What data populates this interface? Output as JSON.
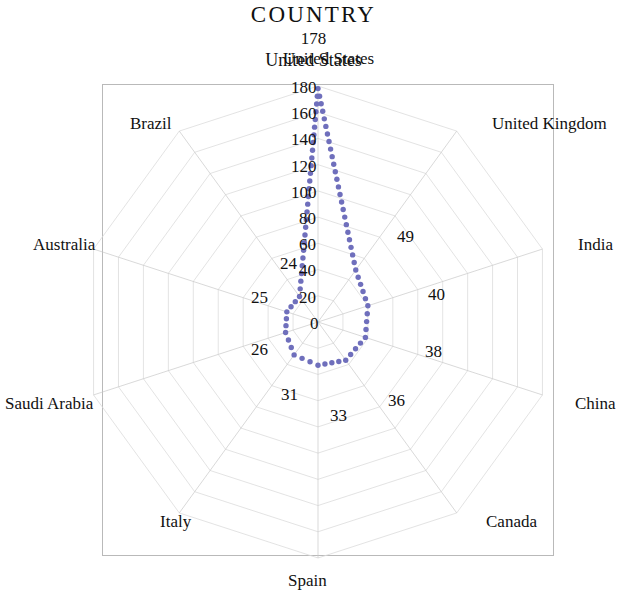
{
  "chart_data": {
    "type": "line",
    "subtype": "radar",
    "title": "COUNTRY",
    "xlabel": "",
    "ylabel": "",
    "grid": true,
    "legend_position": "none",
    "rlim": [
      0,
      180
    ],
    "rticks": [
      0,
      20,
      40,
      60,
      80,
      100,
      120,
      140,
      160,
      180
    ],
    "categories": [
      "United States",
      "United Kingdom",
      "India",
      "China",
      "Canada",
      "Spain",
      "Italy",
      "Saudi Arabia",
      "Australia",
      "Brazil"
    ],
    "values": [
      178,
      49,
      40,
      38,
      36,
      33,
      31,
      26,
      25,
      24
    ],
    "series": [
      {
        "name": "COUNTRY",
        "values": [
          178,
          49,
          40,
          38,
          36,
          33,
          31,
          26,
          25,
          24
        ]
      }
    ],
    "peak": {
      "label": "United States",
      "value": "178"
    },
    "point_labels": [
      {
        "text": "178",
        "category": "United States"
      },
      {
        "text": "49",
        "category": "United Kingdom"
      },
      {
        "text": "40",
        "category": "India"
      },
      {
        "text": "38",
        "category": "China"
      },
      {
        "text": "36",
        "category": "Canada"
      },
      {
        "text": "33",
        "category": "Spain"
      },
      {
        "text": "31",
        "category": "Italy"
      },
      {
        "text": "26",
        "category": "Saudi Arabia"
      },
      {
        "text": "25",
        "category": "Australia"
      },
      {
        "text": "24",
        "category": "Brazil"
      }
    ],
    "colors": {
      "data_line": "#6f6fbc",
      "grid": "#dcdcdc",
      "axis": "#c9c9c9",
      "frame": "#b9b9b9",
      "text": "#111111"
    }
  },
  "axis_labels": [
    {
      "text": "United States",
      "left": 283,
      "top": 50
    },
    {
      "text": "United Kingdom",
      "left": 492,
      "top": 115
    },
    {
      "text": "India",
      "left": 578,
      "top": 236
    },
    {
      "text": "China",
      "left": 575,
      "top": 395
    },
    {
      "text": "Canada",
      "left": 486,
      "top": 513
    },
    {
      "text": "Spain",
      "left": 288,
      "top": 572
    },
    {
      "text": "Italy",
      "left": 160,
      "top": 513
    },
    {
      "text": "Saudi Arabia",
      "left": 5,
      "top": 395
    },
    {
      "text": "Australia",
      "left": 33,
      "top": 236
    },
    {
      "text": "Brazil",
      "left": 130,
      "top": 115
    }
  ],
  "tick_labels": [
    {
      "text": "180",
      "left": 291,
      "top": 79
    },
    {
      "text": "160",
      "left": 291,
      "top": 105
    },
    {
      "text": "140",
      "left": 291,
      "top": 131
    },
    {
      "text": "120",
      "left": 291,
      "top": 158
    },
    {
      "text": "100",
      "left": 291,
      "top": 184
    },
    {
      "text": "80",
      "left": 299,
      "top": 210
    },
    {
      "text": "60",
      "left": 299,
      "top": 236
    },
    {
      "text": "40",
      "left": 299,
      "top": 262
    },
    {
      "text": "20",
      "left": 299,
      "top": 289
    },
    {
      "text": "0",
      "left": 310,
      "top": 315
    }
  ],
  "value_labels": [
    {
      "text": "49",
      "left": 397,
      "top": 228
    },
    {
      "text": "40",
      "left": 428,
      "top": 286
    },
    {
      "text": "38",
      "left": 425,
      "top": 343
    },
    {
      "text": "36",
      "left": 388,
      "top": 392
    },
    {
      "text": "33",
      "left": 330,
      "top": 407
    },
    {
      "text": "31",
      "left": 281,
      "top": 386
    },
    {
      "text": "26",
      "left": 251,
      "top": 341
    },
    {
      "text": "25",
      "left": 251,
      "top": 289
    },
    {
      "text": "24",
      "left": 280,
      "top": 255
    }
  ],
  "plot_frame": {
    "left": 102,
    "top": 84,
    "width": 452,
    "height": 472
  }
}
